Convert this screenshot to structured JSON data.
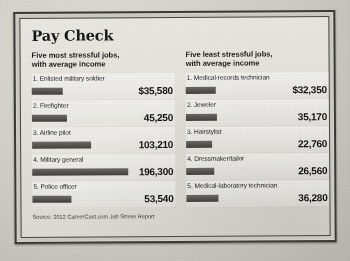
{
  "infographic": {
    "title": "Pay Check",
    "source": "Source: 2012 CareerCast.com Job Stress Report",
    "bar_color": "#56534f",
    "panel_color": "#e6e3dc",
    "columns": [
      {
        "subhead": "Five most stressful jobs,\nwith average income",
        "subhead_line1": "Five most stressful jobs,",
        "subhead_line2": "with average income",
        "rows": [
          {
            "rank": "1.",
            "label": "1. Enlisted military soldier",
            "job": "Enlisted military soldier",
            "amount": "$35,580",
            "value": 35580
          },
          {
            "rank": "2.",
            "label": "2. Firefighter",
            "job": "Firefighter",
            "amount": "45,250",
            "value": 45250
          },
          {
            "rank": "3.",
            "label": "3. Airline pilot",
            "job": "Airline pilot",
            "amount": "103,210",
            "value": 103210
          },
          {
            "rank": "4.",
            "label": "4. Military general",
            "job": "Military general",
            "amount": "196,300",
            "value": 196300
          },
          {
            "rank": "5.",
            "label": "5. Police officer",
            "job": "Police officer",
            "amount": "53,540",
            "value": 53540
          }
        ]
      },
      {
        "subhead": "Five least stressful jobs,\nwith average income",
        "subhead_line1": "Five least stressful jobs,",
        "subhead_line2": "with average income",
        "rows": [
          {
            "rank": "1.",
            "label": "1. Medical-records technician",
            "job": "Medical-records technician",
            "amount": "$32,350",
            "value": 32350
          },
          {
            "rank": "2.",
            "label": "2. Jeweler",
            "job": "Jeweler",
            "amount": "35,170",
            "value": 35170
          },
          {
            "rank": "3.",
            "label": "3. Hairstylist",
            "job": "Hairstylist",
            "amount": "22,760",
            "value": 22760
          },
          {
            "rank": "4.",
            "label": "4. Dressmaker/tailor",
            "job": "Dressmaker/tailor",
            "amount": "26,560",
            "value": 26560
          },
          {
            "rank": "5.",
            "label": "5. Medical-laboratory technician",
            "job": "Medical-laboratory technician",
            "amount": "36,280",
            "value": 36280
          }
        ]
      }
    ]
  },
  "chart_data": {
    "type": "bar",
    "title": "Pay Check",
    "subtitle": "Average income for the five most and five least stressful jobs",
    "xlabel": "Average income (USD)",
    "ylabel": "",
    "xlim": [
      0,
      196300
    ],
    "grid": false,
    "legend": "none",
    "orientation": "horizontal",
    "annotation": "Source: 2012 CareerCast.com Job Stress Report",
    "groups": [
      {
        "name": "Five most stressful jobs, with average income",
        "categories": [
          "1. Enlisted military soldier",
          "2. Firefighter",
          "3. Airline pilot",
          "4. Military general",
          "5. Police officer"
        ],
        "values": [
          35580,
          45250,
          103210,
          196300,
          53540
        ],
        "labels": [
          "$35,580",
          "45,250",
          "103,210",
          "196,300",
          "53,540"
        ]
      },
      {
        "name": "Five least stressful jobs, with average income",
        "categories": [
          "1. Medical-records technician",
          "2. Jeweler",
          "3. Hairstylist",
          "4. Dressmaker/tailor",
          "5. Medical-laboratory technician"
        ],
        "values": [
          32350,
          35170,
          22760,
          26560,
          36280
        ],
        "labels": [
          "$32,350",
          "35,170",
          "22,760",
          "26,560",
          "36,280"
        ]
      }
    ]
  }
}
